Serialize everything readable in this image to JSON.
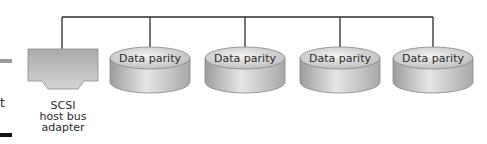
{
  "diagram": {
    "bus": {
      "y": 17,
      "x_start": 62,
      "x_end": 433,
      "color": "#2b2b2b"
    },
    "adapter": {
      "label_lines": [
        "SCSI",
        "host bus",
        "adapter"
      ],
      "fill": "#b9b9b9"
    },
    "disks": [
      {
        "label": "Data parity",
        "cx": 150
      },
      {
        "label": "Data parity",
        "cx": 245
      },
      {
        "label": "Data parity",
        "cx": 340
      },
      {
        "label": "Data parity",
        "cx": 433
      }
    ],
    "left_fragment": {
      "text": "t"
    },
    "colors": {
      "disk_top": "#dcdcdc",
      "disk_side": "#b5b5b5",
      "line": "#2b2b2b",
      "gray_bar": "#9a9a9a",
      "black_bar": "#111111"
    }
  }
}
